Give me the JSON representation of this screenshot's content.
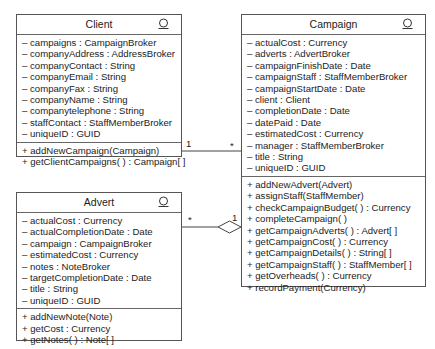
{
  "classes": {
    "client": {
      "name": "Client",
      "icon": "entity-class-icon",
      "attributes": [
        "– campaigns : CampaignBroker",
        "– companyAddress : AddressBroker",
        "– companyContact : String",
        "– companyEmail : String",
        "– companyFax : String",
        "– companyName : String",
        "– companytelephone : String",
        "– staffContact : StaffMemberBroker",
        "– uniqueID : GUID"
      ],
      "operations": [
        "+ addNewCampaign(Campaign)",
        "+ getClientCampaigns( ) : Campaign[ ]"
      ]
    },
    "campaign": {
      "name": "Campaign",
      "icon": "entity-class-icon",
      "attributes": [
        "– actualCost : Currency",
        "– adverts : AdvertBroker",
        "– campaignFinishDate : Date",
        "– campaignStaff : StaffMemberBroker",
        "– campaignStartDate : Date",
        "– client : Client",
        "– completionDate : Date",
        "– datePaid : Date",
        "– estimatedCost : Currency",
        "– manager : StaffMemberBroker",
        "– title : String",
        "– uniqueID : GUID"
      ],
      "operations": [
        "+ addNewAdvert(Advert)",
        "+ assignStaff(StaffMember)",
        "+ checkCampaignBudget( ) : Currency",
        "+ completeCampaign( )",
        "+ getCampaignAdverts( ) : Advert[ ]",
        "+ getCampaignCost( ) : Currency",
        "+ getCampaignDetails( ) : String[ ]",
        "+ getCampaignStaff( ) : StaffMember[ ]",
        "+ getOverheads( ) : Currency",
        "+ recordPayment(Currency)"
      ]
    },
    "advert": {
      "name": "Advert",
      "icon": "entity-class-icon",
      "attributes": [
        "– actualCost : Currency",
        "– actualCompletionDate : Date",
        "– campaign : CampaignBroker",
        "– estimatedCost : Currency",
        "– notes : NoteBroker",
        "– targetCompletionDate : Date",
        "– title : String",
        "– uniqueID : GUID"
      ],
      "operations": [
        "+ addNewNote(Note)",
        "+ getCost : Currency",
        "+ getNotes( ) : Note[ ]"
      ]
    }
  },
  "associations": [
    {
      "from": "Client",
      "to": "Campaign",
      "type": "association",
      "from_mult": "1",
      "to_mult": "*"
    },
    {
      "from": "Advert",
      "to": "Campaign",
      "type": "aggregation",
      "from_mult": "*",
      "to_mult": "1"
    }
  ]
}
